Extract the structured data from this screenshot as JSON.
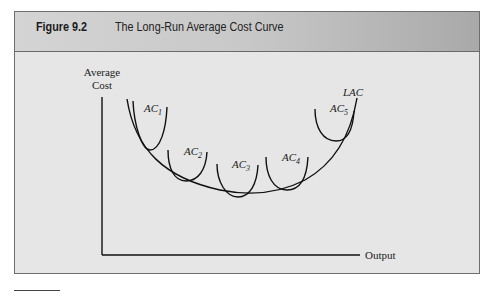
{
  "figure": {
    "number": "Figure 9.2",
    "title": "The Long-Run Average Cost Curve"
  },
  "axes": {
    "y_label_line1": "Average",
    "y_label_line2": "Cost",
    "x_label": "Output"
  },
  "curves": {
    "lac": "LAC",
    "ac": [
      {
        "base": "AC",
        "sub": "1"
      },
      {
        "base": "AC",
        "sub": "2"
      },
      {
        "base": "AC",
        "sub": "3"
      },
      {
        "base": "AC",
        "sub": "4"
      },
      {
        "base": "AC",
        "sub": "5"
      }
    ]
  },
  "colors": {
    "header_light": "#d4d4d4",
    "header_dark": "#a9a9a9",
    "panel": "#e6e6e6",
    "ink": "#111111"
  }
}
